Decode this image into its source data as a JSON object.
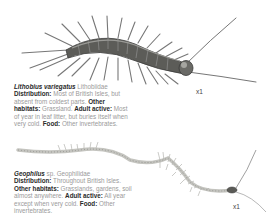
{
  "entries": [
    {
      "species": "Lithobius variegatus",
      "family": "Lithobiidae",
      "distribution_label": "Distribution",
      "distribution": "Most of British Isles, but absent from coldest parts.",
      "other_habitats_label": "Other habitats",
      "other_habitats": "Grassland.",
      "adult_active_label": "Adult active",
      "adult_active": "Most of year in leaf litter, but buries itself when very cold.",
      "food_label": "Food",
      "food": "Other invertebrates.",
      "scale": "x1",
      "illustration": "centipede-lithobius-illustration"
    },
    {
      "species": "Geophilus",
      "species_suffix": "sp.",
      "family": "Geophilidae",
      "distribution_label": "Distribution",
      "distribution": "Throughout British Isles.",
      "other_habitats_label": "Other habitats",
      "other_habitats": "Grasslands, gardens, soil almost anywhere.",
      "adult_active_label": "Adult active",
      "adult_active": "All year except when very cold.",
      "food_label": "Food",
      "food": "Other invertebrates.",
      "scale": "x1",
      "illustration": "centipede-geophilus-illustration"
    }
  ],
  "colors": {
    "body_dark": "#4a4a48",
    "body_mid": "#7a7a76",
    "leg": "#6d6d6a",
    "pale_body": "#c9c9c4"
  }
}
